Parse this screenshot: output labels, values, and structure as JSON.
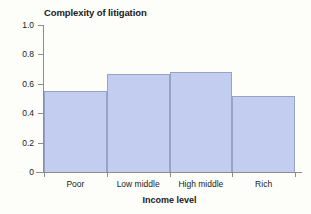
{
  "chart_data": {
    "type": "bar",
    "title": "Complexity of litigation",
    "xlabel": "Income level",
    "ylabel": "",
    "categories": [
      "Poor",
      "Low middle",
      "High middle",
      "Rich"
    ],
    "values": [
      0.55,
      0.665,
      0.68,
      0.52
    ],
    "ylim": [
      0,
      1.0
    ],
    "yticks": [
      0,
      0.2,
      0.4,
      0.6,
      0.8,
      1.0
    ],
    "ytick_labels": [
      "0",
      "0.2",
      "0.4",
      "0.6",
      "0.8",
      "1.0"
    ],
    "grid": false,
    "legend": null,
    "bar_gap": 0,
    "colors": {
      "bar_fill": "#c3cdef",
      "bar_edge": "#97a3c6",
      "axis": "#8c8c8c",
      "text": "#1a1a1a",
      "background": "#fdfdfa"
    }
  }
}
